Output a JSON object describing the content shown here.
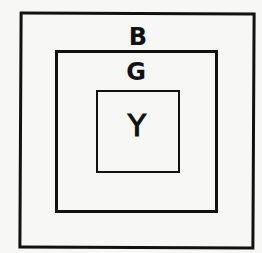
{
  "diagram": {
    "type": "nested-squares",
    "boxes": [
      {
        "id": "outer",
        "label": "B"
      },
      {
        "id": "middle",
        "label": "G"
      },
      {
        "id": "inner",
        "label": "Y"
      }
    ]
  }
}
